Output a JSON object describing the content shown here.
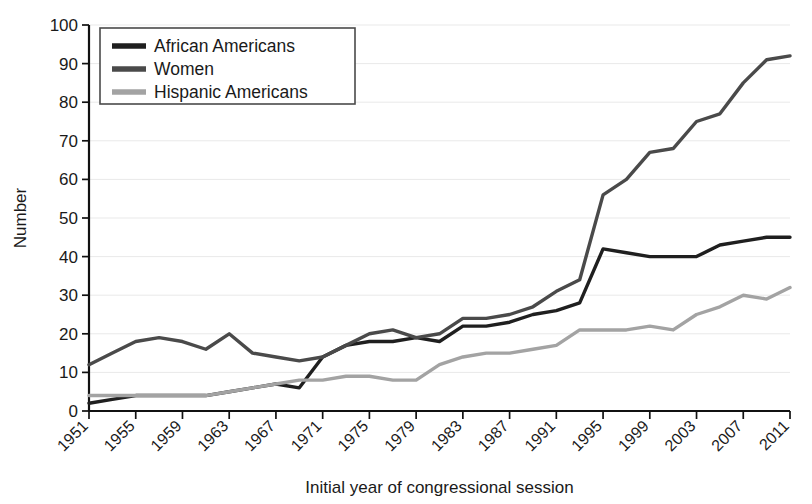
{
  "chart_data": {
    "type": "line",
    "title": "",
    "xlabel": "Initial year of congressional session",
    "ylabel": "Number",
    "xlim": [
      1951,
      2011
    ],
    "ylim": [
      0,
      100
    ],
    "grid": true,
    "legend_position": "top-left",
    "xtick_labels": [
      "1951",
      "1955",
      "1959",
      "1963",
      "1967",
      "1971",
      "1975",
      "1979",
      "1983",
      "1987",
      "1991",
      "1995",
      "1999",
      "2003",
      "2007",
      "2011"
    ],
    "ytick_labels": [
      "0",
      "10",
      "20",
      "30",
      "40",
      "50",
      "60",
      "70",
      "80",
      "90",
      "100"
    ],
    "x": [
      1951,
      1953,
      1955,
      1957,
      1959,
      1961,
      1963,
      1965,
      1967,
      1969,
      1971,
      1973,
      1975,
      1977,
      1979,
      1981,
      1983,
      1985,
      1987,
      1989,
      1991,
      1993,
      1995,
      1997,
      1999,
      2001,
      2003,
      2005,
      2007,
      2009,
      2011
    ],
    "series": [
      {
        "name": "African Americans",
        "color": "#1f1f1f",
        "values": [
          2,
          3,
          4,
          4,
          4,
          4,
          5,
          6,
          7,
          6,
          14,
          17,
          18,
          18,
          19,
          18,
          22,
          22,
          23,
          25,
          26,
          28,
          42,
          41,
          40,
          40,
          40,
          43,
          44,
          45,
          45
        ]
      },
      {
        "name": "Women",
        "color": "#4a4a4a",
        "values": [
          12,
          15,
          18,
          19,
          18,
          16,
          20,
          15,
          14,
          13,
          14,
          17,
          20,
          21,
          19,
          20,
          24,
          24,
          25,
          27,
          31,
          34,
          56,
          60,
          67,
          68,
          75,
          77,
          85,
          91,
          92
        ]
      },
      {
        "name": "Hispanic Americans",
        "color": "#a3a3a3",
        "values": [
          4,
          4,
          4,
          4,
          4,
          4,
          5,
          6,
          7,
          8,
          8,
          9,
          9,
          8,
          8,
          12,
          14,
          15,
          15,
          16,
          17,
          21,
          21,
          21,
          22,
          21,
          25,
          27,
          30,
          29,
          32
        ]
      }
    ]
  },
  "legend": {
    "entries": [
      {
        "label": "African Americans"
      },
      {
        "label": "Women"
      },
      {
        "label": "Hispanic Americans"
      }
    ]
  }
}
